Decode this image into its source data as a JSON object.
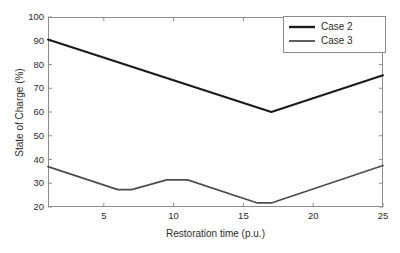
{
  "chart_data": {
    "type": "line",
    "title": "",
    "xlabel": "Restoration time (p.u.)",
    "ylabel": "State of Charge (%)",
    "xlim": [
      1,
      25
    ],
    "ylim": [
      20,
      100
    ],
    "xticks": [
      5,
      10,
      15,
      20,
      25
    ],
    "yticks": [
      20,
      30,
      40,
      50,
      60,
      70,
      80,
      90,
      100
    ],
    "grid": false,
    "legend_position": "top-right",
    "series": [
      {
        "name": "Case 2",
        "color": "#1a1a1a",
        "x": [
          1,
          17,
          25
        ],
        "y": [
          90.5,
          60.0,
          75.5
        ]
      },
      {
        "name": "Case 3",
        "color": "#4d4d4d",
        "x": [
          1,
          6,
          7,
          9.5,
          11,
          16,
          17,
          25
        ],
        "y": [
          37.0,
          27.3,
          27.3,
          31.4,
          31.4,
          21.7,
          21.7,
          37.5
        ]
      }
    ]
  },
  "legend": {
    "entries": [
      {
        "label": "Case 2",
        "color": "#1a1a1a"
      },
      {
        "label": "Case 3",
        "color": "#4d4d4d"
      }
    ]
  },
  "axes": {
    "x_title": "Restoration time (p.u.)",
    "y_title": "State of Charge (%)",
    "x_tick_labels": [
      "5",
      "10",
      "15",
      "20",
      "25"
    ],
    "y_tick_labels": [
      "100",
      "90",
      "80",
      "70",
      "60",
      "50",
      "40",
      "30",
      "20"
    ]
  },
  "colors": {
    "axis": "#8c8c8c",
    "text": "#2b2b2b",
    "background": "#ffffff",
    "series_1": "#1a1a1a",
    "series_2": "#4d4d4d"
  }
}
